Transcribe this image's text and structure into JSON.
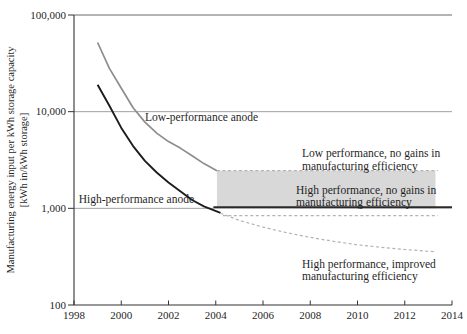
{
  "figure": {
    "background": "#ffffff",
    "text_color": "#1f1f1f"
  },
  "chart_data": {
    "type": "line",
    "title": "",
    "xlabel": "",
    "ylabel_lines": [
      "Manufacturing energy input per kWh storage capacity",
      "[kWh in/kWh storage]"
    ],
    "x_range": [
      1998,
      2014
    ],
    "y_range": [
      100,
      100000
    ],
    "y_scale": "log",
    "grid": "horizontal-only",
    "legend": "none (direct labels)",
    "gridlines": [
      10000,
      1000
    ],
    "x_ticks": [
      {
        "value": 1998,
        "label": "1998"
      },
      {
        "value": 2000,
        "label": "2000"
      },
      {
        "value": 2002,
        "label": "2002"
      },
      {
        "value": 2004,
        "label": "2004"
      },
      {
        "value": 2006,
        "label": "2006"
      },
      {
        "value": 2008,
        "label": "2008"
      },
      {
        "value": 2010,
        "label": "2010"
      },
      {
        "value": 2012,
        "label": "2012"
      },
      {
        "value": 2014,
        "label": "2014"
      }
    ],
    "y_ticks": [
      {
        "value": 100000,
        "label": "100,000"
      },
      {
        "value": 10000,
        "label": "10,000"
      },
      {
        "value": 1000,
        "label": "1,000"
      },
      {
        "value": 100,
        "label": "100"
      }
    ],
    "band": {
      "name": "high-performance no-gains uncertainty band",
      "x": [
        2004.05,
        2013.3
      ],
      "y": [
        1000,
        2450
      ],
      "fill": "#d8d8d8"
    },
    "series": [
      {
        "name": "Low-performance anode",
        "color": "#8d8d8d",
        "width": 1.7,
        "dash": null,
        "points": [
          [
            1999,
            52000
          ],
          [
            1999.5,
            28000
          ],
          [
            2000,
            17500
          ],
          [
            2000.5,
            11000
          ],
          [
            2001,
            7800
          ],
          [
            2001.5,
            6000
          ],
          [
            2002,
            4900
          ],
          [
            2002.5,
            4200
          ],
          [
            2003,
            3500
          ],
          [
            2003.5,
            2900
          ],
          [
            2004.05,
            2450
          ]
        ]
      },
      {
        "name": "High-performance anode",
        "color": "#1c1c1c",
        "width": 1.9,
        "dash": null,
        "points": [
          [
            1999,
            19000
          ],
          [
            1999.5,
            11500
          ],
          [
            2000,
            6800
          ],
          [
            2000.5,
            4400
          ],
          [
            2001,
            3100
          ],
          [
            2001.5,
            2350
          ],
          [
            2002,
            1850
          ],
          [
            2002.5,
            1500
          ],
          [
            2003,
            1220
          ],
          [
            2003.5,
            1050
          ],
          [
            2004.2,
            900
          ]
        ]
      },
      {
        "name": "Low performance, no gains in manufacturing efficiency",
        "color": "#b3b3b3",
        "width": 1.2,
        "dash": "3,2.5",
        "points": [
          [
            2004.05,
            2450
          ],
          [
            2013.4,
            2450
          ]
        ]
      },
      {
        "name": "High performance, no gains in manufacturing efficiency",
        "color": "#2a2a2a",
        "width": 1.6,
        "dash": null,
        "points": [
          [
            2003.9,
            1030
          ],
          [
            2014,
            1030
          ]
        ]
      },
      {
        "name": "High performance, no gains lower bound",
        "color": "#b3b3b3",
        "width": 1.2,
        "dash": "3,2.5",
        "points": [
          [
            2004.3,
            840
          ],
          [
            2013.4,
            840
          ]
        ]
      },
      {
        "name": "High performance, improved manufacturing efficiency",
        "color": "#b3b3b3",
        "width": 1.2,
        "dash": "3,2.5",
        "points": [
          [
            2004.2,
            890
          ],
          [
            2005,
            750
          ],
          [
            2006,
            640
          ],
          [
            2007,
            560
          ],
          [
            2008,
            500
          ],
          [
            2009,
            455
          ],
          [
            2010,
            420
          ],
          [
            2011,
            395
          ],
          [
            2012,
            375
          ],
          [
            2013.3,
            355
          ]
        ]
      }
    ],
    "annotations": [
      {
        "id": "low-performance-anode-label",
        "lines": [
          "Low-performance anode"
        ],
        "x": 2001.0,
        "v": 8800,
        "anchor": "start",
        "font_size": 11.5
      },
      {
        "id": "high-performance-anode-label",
        "lines": [
          "High-performance anode"
        ],
        "x": 1998.2,
        "v": 1250,
        "anchor": "start",
        "font_size": 11.5
      },
      {
        "id": "low-no-gains-label",
        "lines": [
          "Low performance, no gains in",
          "manufacturing efficiency"
        ],
        "x": 2007.65,
        "v": 3730,
        "anchor": "start",
        "font_size": 11.5
      },
      {
        "id": "high-no-gains-label",
        "lines": [
          "High performance, no gains in",
          "manufacturing efficiency"
        ],
        "x": 2007.4,
        "v": 1560,
        "anchor": "start",
        "font_size": 11.5
      },
      {
        "id": "high-improved-label",
        "lines": [
          "High performance, improved",
          "manufacturing efficiency"
        ],
        "x": 2007.65,
        "v": 268,
        "anchor": "start",
        "font_size": 11.5
      }
    ]
  }
}
